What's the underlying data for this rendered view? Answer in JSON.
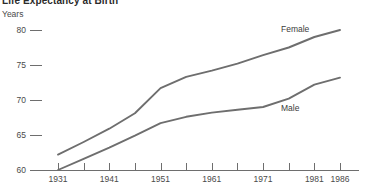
{
  "chart_data": {
    "type": "line",
    "title": "Life Expectancy at Birth",
    "xlabel": "",
    "ylabel": "Years",
    "ylim": [
      60,
      80
    ],
    "xlim": [
      1931,
      1986
    ],
    "grid": false,
    "legend_position": "inline-right",
    "y_ticks": [
      "80",
      "75",
      "70",
      "65",
      "60"
    ],
    "y_tick_values": [
      80,
      75,
      70,
      65,
      60
    ],
    "x_tick_labels": [
      "1931",
      "1941",
      "1951",
      "1961",
      "1971",
      "1981",
      "1986"
    ],
    "x_tick_values": [
      1931,
      1941,
      1951,
      1961,
      1971,
      1981,
      1986
    ],
    "x_minor_ticks": [
      1931,
      1936,
      1941,
      1946,
      1951,
      1956,
      1961,
      1966,
      1971,
      1976,
      1981,
      1986
    ],
    "line_color": "#6e6e6e",
    "axis_color": "#6e6e6e",
    "background_color": "#ffffff",
    "series": [
      {
        "name": "Female",
        "color": "#6e6e6e",
        "x": [
          1931,
          1936,
          1941,
          1946,
          1951,
          1956,
          1961,
          1966,
          1971,
          1976,
          1981,
          1986
        ],
        "values": [
          62.2,
          64.0,
          65.9,
          68.1,
          71.7,
          73.3,
          74.2,
          75.2,
          76.4,
          77.5,
          79.0,
          80.0
        ]
      },
      {
        "name": "Male",
        "color": "#6e6e6e",
        "x": [
          1931,
          1936,
          1941,
          1946,
          1951,
          1956,
          1961,
          1966,
          1971,
          1976,
          1981,
          1986
        ],
        "values": [
          60.0,
          61.6,
          63.2,
          64.9,
          66.7,
          67.6,
          68.2,
          68.6,
          69.0,
          70.2,
          72.2,
          73.2
        ]
      }
    ],
    "annotations": [
      {
        "text": "Female",
        "x": 1981,
        "y": 80.2
      },
      {
        "text": "Male",
        "x": 1981,
        "y": 68.9
      }
    ]
  }
}
